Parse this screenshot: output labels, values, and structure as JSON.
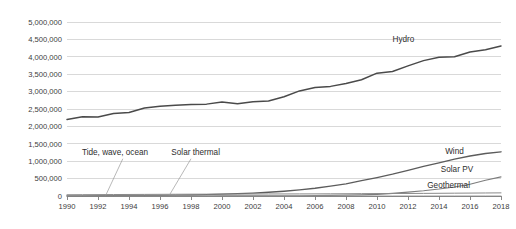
{
  "chart_data": {
    "type": "line",
    "title": "",
    "xlabel": "",
    "ylabel": "",
    "xlim": [
      1990,
      2018
    ],
    "ylim": [
      0,
      5000000
    ],
    "grid": true,
    "legend_position": "inline-series-labels",
    "x": [
      1990,
      1991,
      1992,
      1993,
      1994,
      1995,
      1996,
      1997,
      1998,
      1999,
      2000,
      2001,
      2002,
      2003,
      2004,
      2005,
      2006,
      2007,
      2008,
      2009,
      2010,
      2011,
      2012,
      2013,
      2014,
      2015,
      2016,
      2017,
      2018
    ],
    "x_tick_labels": [
      "1990",
      "1992",
      "1994",
      "1996",
      "1998",
      "2000",
      "2002",
      "2004",
      "2006",
      "2008",
      "2010",
      "2012",
      "2014",
      "2016",
      "2018"
    ],
    "x_ticks": [
      1990,
      1992,
      1994,
      1996,
      1998,
      2000,
      2002,
      2004,
      2006,
      2008,
      2010,
      2012,
      2014,
      2016,
      2018
    ],
    "y_ticks": [
      0,
      500000,
      1000000,
      1500000,
      2000000,
      2500000,
      3000000,
      3500000,
      4000000,
      4500000,
      5000000
    ],
    "y_tick_labels": [
      "0",
      "500,000",
      "1,000,000",
      "1,500,000",
      "2,000,000",
      "2,500,000",
      "3,000,000",
      "3,500,000",
      "4,000,000",
      "4,500,000",
      "5,000,000"
    ],
    "series": [
      {
        "name": "Hydro",
        "label": "Hydro",
        "color": "#4a4a4a",
        "label_x": 2011.0,
        "label_y": 4420000,
        "values": [
          2200000,
          2280000,
          2270000,
          2370000,
          2400000,
          2530000,
          2580000,
          2610000,
          2630000,
          2640000,
          2700000,
          2650000,
          2710000,
          2730000,
          2850000,
          3020000,
          3120000,
          3150000,
          3230000,
          3340000,
          3530000,
          3580000,
          3740000,
          3890000,
          3990000,
          4000000,
          4140000,
          4200000,
          4310000
        ]
      },
      {
        "name": "Wind",
        "label": "Wind",
        "color": "#5c5c5c",
        "label_x": 2015.6,
        "label_y": 1210000,
        "values": [
          3800,
          5200,
          6700,
          8500,
          11000,
          14000,
          18000,
          23000,
          30000,
          40000,
          52000,
          66000,
          84000,
          108000,
          137000,
          175000,
          222000,
          282000,
          349000,
          440000,
          530000,
          627000,
          735000,
          850000,
          950000,
          1060000,
          1150000,
          1220000,
          1270000
        ]
      },
      {
        "name": "Solar PV",
        "label": "Solar PV",
        "color": "#7d7d7d",
        "label_x": 2016.2,
        "label_y": 690000,
        "values": [
          300,
          400,
          500,
          600,
          700,
          900,
          1100,
          1300,
          1600,
          2000,
          2500,
          3000,
          3700,
          4800,
          6500,
          9000,
          12500,
          17000,
          24000,
          33000,
          46000,
          75000,
          110000,
          150000,
          200000,
          260000,
          340000,
          450000,
          550000
        ]
      },
      {
        "name": "Geothermal",
        "label": "Geothermal",
        "color": "#8a8a8a",
        "label_x": 2016.0,
        "label_y": 220000,
        "values": [
          36000,
          38000,
          40000,
          42000,
          44000,
          46000,
          48000,
          50000,
          52000,
          53000,
          54000,
          55000,
          57000,
          58000,
          59000,
          60000,
          61000,
          63000,
          65000,
          68000,
          70000,
          71000,
          73000,
          75000,
          78000,
          81000,
          84000,
          87000,
          90000
        ]
      },
      {
        "name": "Tide, wave, ocean",
        "label": "",
        "color": "#9a9a9a",
        "label_x": null,
        "label_y": null,
        "values": [
          500,
          500,
          500,
          500,
          500,
          500,
          500,
          500,
          500,
          500,
          500,
          500,
          500,
          500,
          500,
          500,
          500,
          500,
          500,
          500,
          500,
          500,
          500,
          500,
          500,
          500,
          1000,
          1000,
          1000
        ]
      }
    ],
    "annotations": [
      {
        "text": "Tide, wave, ocean",
        "text_x": 1993.1,
        "text_y": 1180000,
        "leader_from_x": 1993.6,
        "leader_from_y": 1070000,
        "leader_to_x": 1992.5,
        "leader_to_y": 20000
      },
      {
        "text": "Solar thermal",
        "text_x": 1998.3,
        "text_y": 1180000,
        "leader_from_x": 1998.0,
        "leader_from_y": 1070000,
        "leader_to_x": 1996.6,
        "leader_to_y": 20000
      }
    ]
  }
}
